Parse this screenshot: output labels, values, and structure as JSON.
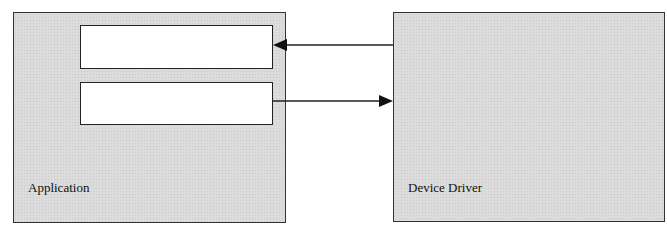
{
  "diagram": {
    "left_box": {
      "label": "Application",
      "fill": "#dcdcdc"
    },
    "right_box": {
      "label": "Device Driver",
      "fill": "#dcdcdc"
    },
    "inner_boxes": [
      {
        "label": ""
      },
      {
        "label": ""
      }
    ],
    "arrows": [
      {
        "from": "Device Driver",
        "to": "Application inner box 1",
        "direction": "left"
      },
      {
        "from": "Application inner box 2",
        "to": "Device Driver",
        "direction": "right"
      }
    ],
    "stroke_color": "#222222"
  }
}
